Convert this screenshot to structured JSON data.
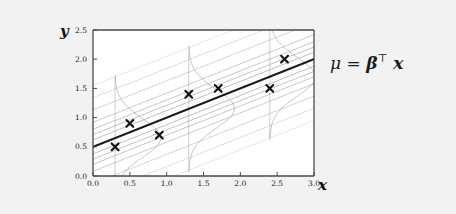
{
  "figure": {
    "background_color": "#f2f2f2",
    "plot_background_color": "#ffffff",
    "frame_color": "#4a4a4a"
  },
  "annotation": {
    "formula_mu": "μ",
    "formula_equals": "=",
    "formula_beta": "β",
    "formula_transpose": "⊤",
    "formula_x": "x",
    "formula_full": "μ = β⊤ x"
  },
  "axis_labels": {
    "y": "y",
    "x": "x"
  },
  "chart_data": {
    "type": "scatter",
    "title": "",
    "subtitle": "",
    "xlabel": "x",
    "ylabel": "y",
    "xlim": [
      0.0,
      3.0
    ],
    "ylim": [
      0.0,
      2.5
    ],
    "grid": false,
    "legend": "none",
    "xticks": [
      "0.0",
      "0.5",
      "1.0",
      "1.5",
      "2.0",
      "2.5",
      "3.0"
    ],
    "xtick_values": [
      0.0,
      0.5,
      1.0,
      1.5,
      2.0,
      2.5,
      3.0
    ],
    "yticks": [
      "0.0",
      "0.5",
      "1.0",
      "1.5",
      "2.0",
      "2.5"
    ],
    "ytick_values": [
      0.0,
      0.5,
      1.0,
      1.5,
      2.0,
      2.5
    ],
    "points": [
      {
        "x": 0.3,
        "y": 0.5
      },
      {
        "x": 0.5,
        "y": 0.9
      },
      {
        "x": 0.9,
        "y": 0.7
      },
      {
        "x": 1.3,
        "y": 1.4
      },
      {
        "x": 1.7,
        "y": 1.5
      },
      {
        "x": 2.4,
        "y": 1.5
      },
      {
        "x": 2.6,
        "y": 2.0
      }
    ],
    "marker": "x",
    "marker_color": "#111111",
    "regression_line": {
      "label": "μ = β⊤ x",
      "intercept": 0.5,
      "slope": 0.5,
      "color": "#1a1a1a",
      "width": 2.0
    },
    "contour_lines": {
      "description": "parallel density contour lines offset from the mean line",
      "color": "#8c8c8c",
      "offsets": [
        -1.05,
        -0.84,
        -0.63,
        -0.42,
        -0.3,
        -0.21,
        -0.12,
        0.12,
        0.21,
        0.3,
        0.42,
        0.63,
        0.84,
        1.05
      ],
      "count": 14
    },
    "density_slices": {
      "description": "vertical gaussian conditional density curves drawn sideways at selected x",
      "color": "#9a9a9a",
      "at_x": [
        0.3,
        1.3,
        2.4
      ],
      "sigma": 0.33
    }
  }
}
